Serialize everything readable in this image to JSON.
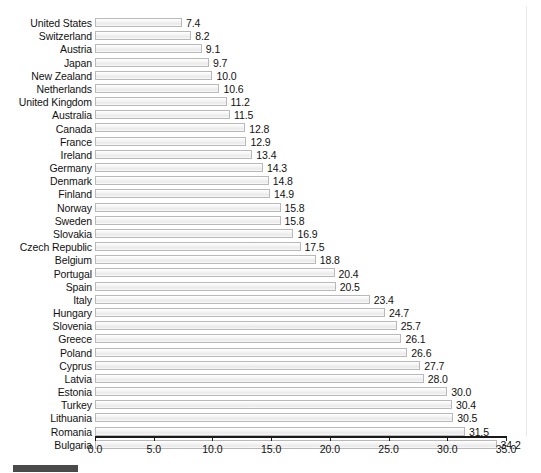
{
  "chart_data": {
    "type": "bar",
    "orientation": "horizontal",
    "title": "",
    "subtitle": "",
    "xlabel": "",
    "ylabel": "",
    "xlim": [
      0.0,
      35.0
    ],
    "grid": false,
    "legend": "none",
    "x_ticks": [
      "0.0",
      "5.0",
      "10.0",
      "15.0",
      "20.0",
      "25.0",
      "30.0",
      "35.0"
    ],
    "x_tick_values": [
      0.0,
      5.0,
      10.0,
      15.0,
      20.0,
      25.0,
      30.0,
      35.0
    ],
    "categories": [
      "United States",
      "Switzerland",
      "Austria",
      "Japan",
      "New Zealand",
      "Netherlands",
      "United Kingdom",
      "Australia",
      "Canada",
      "France",
      "Ireland",
      "Germany",
      "Denmark",
      "Finland",
      "Norway",
      "Sweden",
      "Slovakia",
      "Czech Republic",
      "Belgium",
      "Portugal",
      "Spain",
      "Italy",
      "Hungary",
      "Slovenia",
      "Greece",
      "Poland",
      "Cyprus",
      "Latvia",
      "Estonia",
      "Turkey",
      "Lithuania",
      "Romania",
      "Bulgaria"
    ],
    "values": [
      7.4,
      8.2,
      9.1,
      9.7,
      10.0,
      10.6,
      11.2,
      11.5,
      12.8,
      12.9,
      13.4,
      14.3,
      14.8,
      14.9,
      15.8,
      15.8,
      16.9,
      17.5,
      18.8,
      20.4,
      20.5,
      23.4,
      24.7,
      25.7,
      26.1,
      26.6,
      27.7,
      28.0,
      30.0,
      30.4,
      30.5,
      31.5,
      34.2
    ],
    "value_labels": [
      "7.4",
      "8.2",
      "9.1",
      "9.7",
      "10.0",
      "10.6",
      "11.2",
      "11.5",
      "12.8",
      "12.9",
      "13.4",
      "14.3",
      "14.8",
      "14.9",
      "15.8",
      "15.8",
      "16.9",
      "17.5",
      "18.8",
      "20.4",
      "20.5",
      "23.4",
      "24.7",
      "25.7",
      "26.1",
      "26.6",
      "27.7",
      "28.0",
      "30.0",
      "30.4",
      "30.5",
      "31.5",
      "34.2"
    ],
    "colors": {
      "bar_fill": "#f2f2f2",
      "bar_border": "#b9b9b9",
      "axis": "#1a1a1a",
      "text": "#111111",
      "swatch": "#4a4a4a"
    }
  }
}
